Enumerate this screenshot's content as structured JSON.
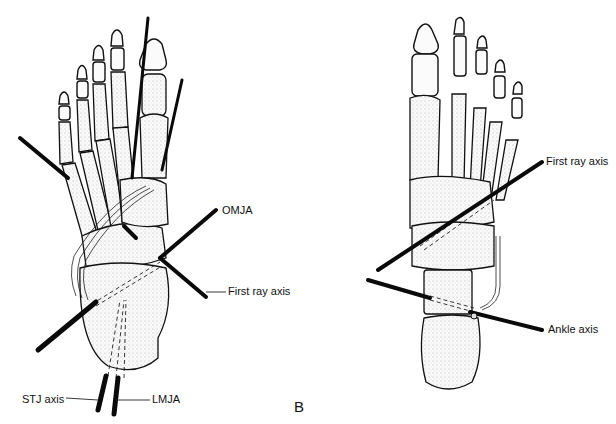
{
  "figure": {
    "panel_label": "B",
    "left_foot": {
      "view": "dorsal, left drawing",
      "labels": {
        "omja": "OMJA",
        "first_ray_axis": "First ray axis",
        "stj_axis": "STJ axis",
        "lmja": "LMJA"
      }
    },
    "right_foot": {
      "view": "plantar, right drawing",
      "labels": {
        "first_ray_axis": "First ray axis",
        "ankle_axis": "Ankle axis"
      }
    }
  },
  "colors": {
    "background": "#ffffff",
    "ink": "#111111"
  }
}
